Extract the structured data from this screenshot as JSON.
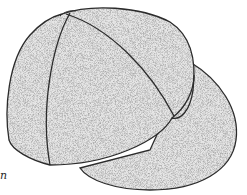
{
  "figure": {
    "panel_label": "n",
    "colors": {
      "outline": "#2b2b2b",
      "stipple_dark": "#6e6e6e",
      "stipple_light": "#bdbdbd",
      "background": "#ffffff"
    }
  }
}
